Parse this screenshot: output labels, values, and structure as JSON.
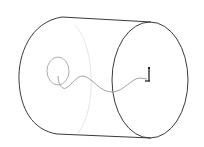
{
  "canvas": {
    "width": 204,
    "height": 147,
    "background": "#ffffff"
  },
  "colors": {
    "edge": "#3a3a3a",
    "hidden_edge": "#e6e6e6",
    "curve": "#9a9a9a",
    "triad": "#222222"
  },
  "model": {
    "type": "cylinder-wireframe",
    "front_face": {
      "cx": 150,
      "cy": 80,
      "rx": 38,
      "ry": 58
    },
    "back_silhouette": "M62,17 C30,22 18,55 19,80 C20,108 32,130 57,134",
    "top_edge": {
      "x1": 62,
      "y1": 17,
      "x2": 151,
      "y2": 22
    },
    "bottom_edge": {
      "x1": 57,
      "y1": 134,
      "x2": 151,
      "y2": 138
    },
    "hidden_arc": "M75,25 C95,45 97,110 78,133",
    "small_circle": {
      "cx": 58,
      "cy": 71,
      "rx": 11,
      "ry": 14
    },
    "wave_curve": "M58,76 C58,84 62,90 66,88 C72,85 76,76 83,76 C92,77 100,93 113,92 C124,91 132,78 140,78 L147,79",
    "triad": {
      "x": 149,
      "y_top": 68,
      "y_bottom": 81
    }
  }
}
